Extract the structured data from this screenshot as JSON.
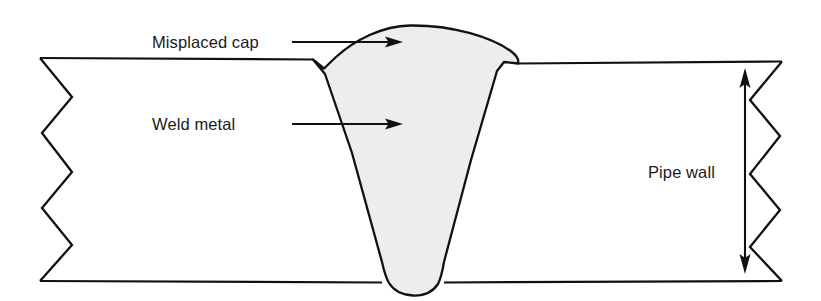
{
  "diagram": {
    "type": "technical-cross-section",
    "canvas": {
      "width": 821,
      "height": 301,
      "background": "#ffffff"
    },
    "colors": {
      "outline": "#111111",
      "weld_fill": "#ededed",
      "background": "#ffffff",
      "text": "#1a1a1a"
    },
    "labels": {
      "misplaced_cap": "Misplaced cap",
      "weld_metal": "Weld metal",
      "pipe_wall": "Pipe wall"
    },
    "annotations": [
      {
        "name": "misplaced-cap",
        "text": "Misplaced cap",
        "text_x": 152,
        "text_y": 48,
        "leader_from_x": 292,
        "leader_to_x": 400,
        "leader_y": 42
      },
      {
        "name": "weld-metal",
        "text": "Weld metal",
        "text_x": 152,
        "text_y": 130,
        "leader_from_x": 292,
        "leader_to_x": 400,
        "leader_y": 124
      },
      {
        "name": "pipe-wall",
        "text": "Pipe wall",
        "text_x": 648,
        "text_y": 178
      }
    ],
    "dimension": {
      "name": "pipe-wall-thickness",
      "x": 745,
      "top_y": 70,
      "bottom_y": 272,
      "double_headed": true
    },
    "geometry": {
      "wall_top_y": 58,
      "wall_bottom_y": 282,
      "wall_left_x": 40,
      "wall_right_x": 782,
      "groove_left_shoulder_x": 313,
      "groove_left_shoulder_y": 60,
      "groove_right_shoulder_x": 518,
      "groove_right_shoulder_y": 64,
      "groove_root_y": 293,
      "cap_peak_x": 428,
      "cap_peak_y": 26
    }
  }
}
